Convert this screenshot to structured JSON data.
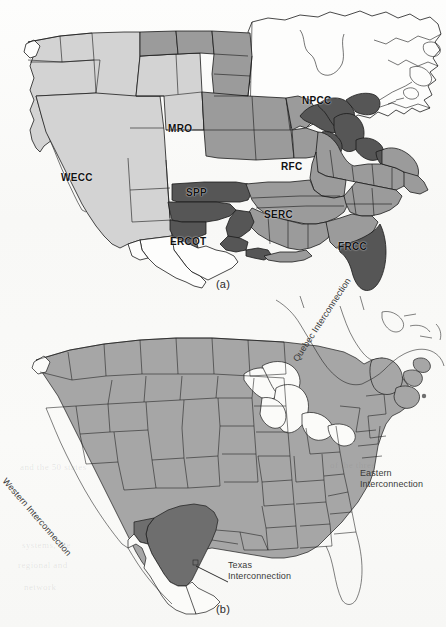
{
  "figure": {
    "background_color": "#fbfbfa",
    "ink_color": "#1a1a1a"
  },
  "palette": {
    "white": "#fdfdfc",
    "light_grey": "#d3d3d3",
    "mid_grey": "#9b9b9b",
    "dark_grey": "#565656",
    "b_base_grey": "#a6a6a6",
    "b_texas_grey": "#6e6e6e",
    "outline": "#1a1a1a"
  },
  "panel_a": {
    "caption": "(a)",
    "labels": [
      {
        "id": "npcc",
        "text": "NPCC",
        "x": 304,
        "y": 101,
        "fill": "white"
      },
      {
        "id": "mro",
        "text": "MRO",
        "x": 170,
        "y": 129,
        "fill": "mid_grey"
      },
      {
        "id": "rfc",
        "text": "RFC",
        "x": 283,
        "y": 166,
        "fill": "mid_grey"
      },
      {
        "id": "wecc",
        "text": "WECC",
        "x": 63,
        "y": 178,
        "fill": "light_grey"
      },
      {
        "id": "spp",
        "text": "SPP",
        "x": 188,
        "y": 192,
        "fill": "dark_grey"
      },
      {
        "id": "serc",
        "text": "SERC",
        "x": 266,
        "y": 214,
        "fill": "mid_grey"
      },
      {
        "id": "ercot",
        "text": "ERCOT",
        "x": 172,
        "y": 242,
        "fill": "white"
      },
      {
        "id": "frcc",
        "text": "FRCC",
        "x": 340,
        "y": 246,
        "fill": "dark_grey"
      }
    ]
  },
  "panel_b": {
    "caption": "(b)",
    "labels": [
      {
        "id": "quebec",
        "text": "Quebec Interconnection",
        "lines": [
          "Quebec",
          "Interconnection"
        ],
        "x": 300,
        "y": 358,
        "rotation": -57
      },
      {
        "id": "western",
        "text": "Western Interconnection",
        "lines": [
          "Western",
          "Interconnection"
        ],
        "x": 10,
        "y": 480,
        "rotation": 49
      },
      {
        "id": "eastern",
        "text": "Eastern Interconnection",
        "lines": [
          "Eastern",
          "Interconnection"
        ],
        "x": 358,
        "y": 470,
        "rotation": 0
      },
      {
        "id": "texas",
        "text": "Texas Interconnection",
        "lines": [
          "Texas",
          "Interconnection"
        ],
        "x": 228,
        "y": 565,
        "rotation": 0
      }
    ],
    "leader_line": {
      "from_x": 196,
      "from_y": 570,
      "to_x": 226,
      "to_y": 586
    }
  },
  "bleed_text": [
    {
      "text": "and the 50 states",
      "x": 20,
      "y": 462
    },
    {
      "text": "of the three",
      "x": 330,
      "y": 460
    },
    {
      "text": "systems, the",
      "x": 22,
      "y": 540
    },
    {
      "text": "regional and",
      "x": 18,
      "y": 560
    },
    {
      "text": "network",
      "x": 24,
      "y": 582
    }
  ]
}
